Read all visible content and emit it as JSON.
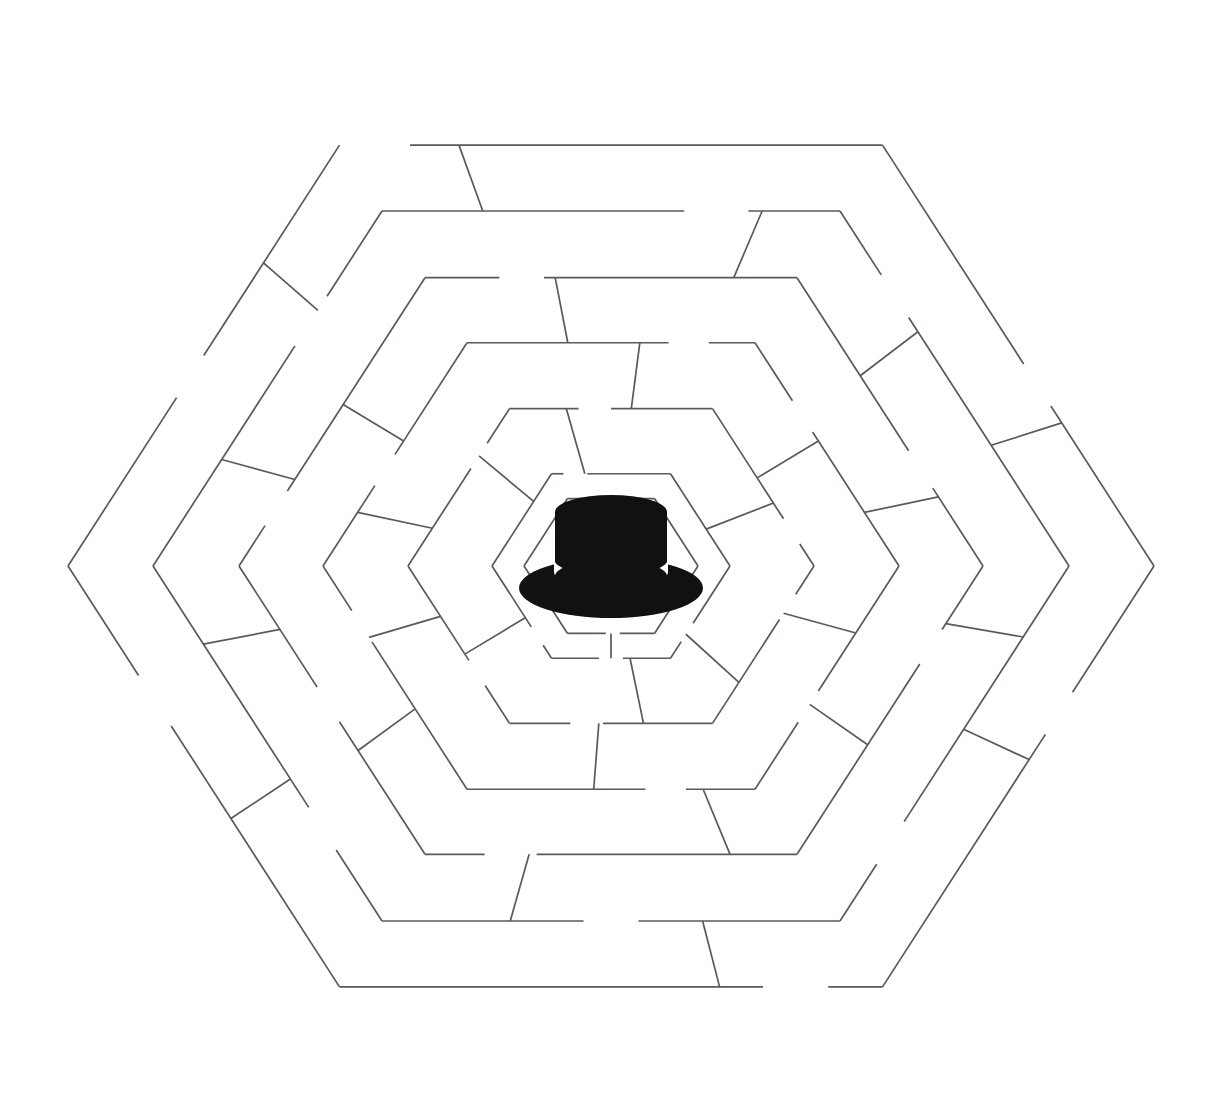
{
  "scene": {
    "title": "Hexagonal Maze with Hat at Center",
    "kind": "puzzle-maze",
    "width": 1226,
    "height": 1120,
    "background_color": "#ffffff",
    "wall_color": "#555b60",
    "wall_width": 1.7
  },
  "maze": {
    "shape": "hexagon",
    "orientation": "flat-top",
    "center": {
      "x": 611,
      "y": 566
    },
    "outer_radius": 543,
    "ring_count": 6,
    "ring_radii": [
      543,
      458,
      372,
      288,
      203,
      119,
      87
    ],
    "ring_labels": [
      "ring-outer-1",
      "ring-2",
      "ring-3",
      "ring-4",
      "ring-5",
      "ring-6",
      "ring-inner-goal"
    ],
    "goal_label": "center-chamber",
    "gap_note": "Each hexagonal ring has openings; short radial walls connect adjacent rings."
  },
  "rings": [
    {
      "name": "ring-outer-1",
      "radius": 543,
      "gaps": [
        {
          "side": 0,
          "start": 0.0,
          "end": 0.13
        },
        {
          "side": 1,
          "start": 0.52,
          "end": 0.62
        },
        {
          "side": 2,
          "start": 0.3,
          "end": 0.4
        },
        {
          "side": 3,
          "start": 0.1,
          "end": 0.22
        },
        {
          "side": 4,
          "start": 0.62,
          "end": 0.74
        },
        {
          "side": 5,
          "start": 0.4,
          "end": 0.5
        }
      ]
    },
    {
      "name": "ring-2",
      "radius": 458,
      "gaps": [
        {
          "side": 0,
          "start": 0.66,
          "end": 0.8
        },
        {
          "side": 1,
          "start": 0.18,
          "end": 0.3
        },
        {
          "side": 2,
          "start": 0.72,
          "end": 0.84
        },
        {
          "side": 3,
          "start": 0.44,
          "end": 0.56
        },
        {
          "side": 4,
          "start": 0.2,
          "end": 0.32
        },
        {
          "side": 5,
          "start": 0.62,
          "end": 0.76
        }
      ]
    },
    {
      "name": "ring-3",
      "radius": 372,
      "gaps": [
        {
          "side": 0,
          "start": 0.2,
          "end": 0.32
        },
        {
          "side": 1,
          "start": 0.6,
          "end": 0.73
        },
        {
          "side": 2,
          "start": 0.22,
          "end": 0.34
        },
        {
          "side": 3,
          "start": 0.7,
          "end": 0.84
        },
        {
          "side": 4,
          "start": 0.46,
          "end": 0.58
        },
        {
          "side": 5,
          "start": 0.14,
          "end": 0.26
        }
      ]
    },
    {
      "name": "ring-4",
      "radius": 288,
      "gaps": [
        {
          "side": 0,
          "start": 0.7,
          "end": 0.84
        },
        {
          "side": 1,
          "start": 0.26,
          "end": 0.4
        },
        {
          "side": 2,
          "start": 0.56,
          "end": 0.7
        },
        {
          "side": 3,
          "start": 0.24,
          "end": 0.38
        },
        {
          "side": 4,
          "start": 0.66,
          "end": 0.8
        },
        {
          "side": 5,
          "start": 0.36,
          "end": 0.5
        }
      ]
    },
    {
      "name": "ring-5",
      "radius": 203,
      "gaps": [
        {
          "side": 0,
          "start": 0.34,
          "end": 0.5
        },
        {
          "side": 1,
          "start": 0.7,
          "end": 0.86
        },
        {
          "side": 2,
          "start": 0.18,
          "end": 0.34
        },
        {
          "side": 3,
          "start": 0.54,
          "end": 0.7
        },
        {
          "side": 4,
          "start": 0.24,
          "end": 0.4
        },
        {
          "side": 5,
          "start": 0.62,
          "end": 0.78
        }
      ]
    },
    {
      "name": "ring-6",
      "radius": 119,
      "gaps": [
        {
          "side": 0,
          "start": 0.1,
          "end": 0.3
        },
        {
          "side": 2,
          "start": 0.62,
          "end": 0.82
        },
        {
          "side": 3,
          "start": 0.4,
          "end": 0.6
        },
        {
          "side": 4,
          "start": 0.14,
          "end": 0.34
        }
      ]
    },
    {
      "name": "ring-inner-goal",
      "radius": 87,
      "gaps": [
        {
          "side": 3,
          "start": 0.4,
          "end": 0.56
        }
      ]
    }
  ],
  "spokes": [
    {
      "name": "spoke-n-a",
      "side": 0,
      "t": 0.22,
      "from": 0,
      "to": 1
    },
    {
      "name": "spoke-n-b",
      "side": 0,
      "t": 0.83,
      "from": 1,
      "to": 2
    },
    {
      "name": "spoke-n-c",
      "side": 0,
      "t": 0.35,
      "from": 2,
      "to": 3
    },
    {
      "name": "spoke-n-d",
      "side": 0,
      "t": 0.6,
      "from": 3,
      "to": 4
    },
    {
      "name": "spoke-n-e",
      "side": 0,
      "t": 0.28,
      "from": 4,
      "to": 5
    },
    {
      "name": "spoke-ne-a",
      "side": 1,
      "t": 0.66,
      "from": 0,
      "to": 1
    },
    {
      "name": "spoke-ne-b",
      "side": 1,
      "t": 0.34,
      "from": 1,
      "to": 2
    },
    {
      "name": "spoke-ne-c",
      "side": 1,
      "t": 0.76,
      "from": 2,
      "to": 3
    },
    {
      "name": "spoke-ne-d",
      "side": 1,
      "t": 0.44,
      "from": 3,
      "to": 4
    },
    {
      "name": "spoke-ne-e",
      "side": 1,
      "t": 0.6,
      "from": 4,
      "to": 5
    },
    {
      "name": "spoke-se-a",
      "side": 2,
      "t": 0.46,
      "from": 0,
      "to": 1
    },
    {
      "name": "spoke-se-b",
      "side": 2,
      "t": 0.2,
      "from": 1,
      "to": 2
    },
    {
      "name": "spoke-se-c",
      "side": 2,
      "t": 0.62,
      "from": 2,
      "to": 3
    },
    {
      "name": "spoke-se-d",
      "side": 2,
      "t": 0.3,
      "from": 3,
      "to": 4
    },
    {
      "name": "spoke-se-e",
      "side": 2,
      "t": 0.74,
      "from": 4,
      "to": 5
    },
    {
      "name": "spoke-s-a",
      "side": 3,
      "t": 0.3,
      "from": 0,
      "to": 1
    },
    {
      "name": "spoke-s-b",
      "side": 3,
      "t": 0.72,
      "from": 1,
      "to": 2
    },
    {
      "name": "spoke-s-c",
      "side": 3,
      "t": 0.18,
      "from": 2,
      "to": 3
    },
    {
      "name": "spoke-s-d",
      "side": 3,
      "t": 0.56,
      "from": 3,
      "to": 4
    },
    {
      "name": "spoke-s-e",
      "side": 3,
      "t": 0.34,
      "from": 4,
      "to": 5
    },
    {
      "name": "spoke-s-f",
      "side": 3,
      "t": 0.5,
      "from": 5,
      "to": 6
    },
    {
      "name": "spoke-sw-a",
      "side": 4,
      "t": 0.4,
      "from": 0,
      "to": 1
    },
    {
      "name": "spoke-sw-b",
      "side": 4,
      "t": 0.78,
      "from": 1,
      "to": 2
    },
    {
      "name": "spoke-sw-c",
      "side": 4,
      "t": 0.36,
      "from": 2,
      "to": 3
    },
    {
      "name": "spoke-sw-d",
      "side": 4,
      "t": 0.68,
      "from": 3,
      "to": 4
    },
    {
      "name": "spoke-sw-e",
      "side": 4,
      "t": 0.44,
      "from": 4,
      "to": 5
    },
    {
      "name": "spoke-nw-a",
      "side": 5,
      "t": 0.72,
      "from": 0,
      "to": 1
    },
    {
      "name": "spoke-nw-b",
      "side": 5,
      "t": 0.3,
      "from": 1,
      "to": 2
    },
    {
      "name": "spoke-nw-c",
      "side": 5,
      "t": 0.56,
      "from": 2,
      "to": 3
    },
    {
      "name": "spoke-nw-d",
      "side": 5,
      "t": 0.24,
      "from": 3,
      "to": 4
    },
    {
      "name": "spoke-nw-e",
      "side": 5,
      "t": 0.7,
      "from": 4,
      "to": 5
    }
  ],
  "hat": {
    "name": "boater-hat",
    "center": {
      "x": 611,
      "y": 558
    },
    "crown_color": "#111111",
    "band_color": "#ffffff",
    "brim_color": "#111111",
    "brim_rx": 92,
    "brim_ry": 30,
    "crown_rx": 56,
    "crown_height": 52
  }
}
